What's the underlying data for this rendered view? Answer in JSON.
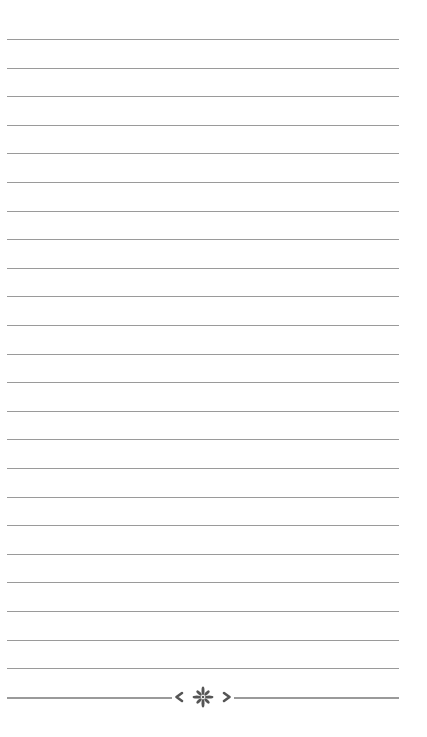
{
  "page": {
    "type": "lined-notepaper",
    "background_color": "#ffffff",
    "line_color": "#9a9a9a",
    "ornament_color": "#555555",
    "line_count": 24,
    "first_line_y": 39,
    "line_spacing": 28.6,
    "line_left": 7,
    "line_width": 392
  },
  "footer": {
    "ornament": {
      "left_icon": "chevron-left-icon",
      "center_icon": "flower-burst-icon",
      "right_icon": "chevron-right-icon"
    }
  }
}
